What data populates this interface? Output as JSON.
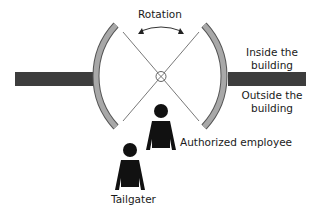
{
  "diagram": {
    "type": "revolving-door-tailgating",
    "labels": {
      "rotation": "Rotation",
      "inside_line1": "Inside the",
      "inside_line2": "building",
      "outside_line1": "Outside the",
      "outside_line2": "building",
      "authorized": "Authorized employee",
      "tailgater": "Tailgater"
    },
    "colors": {
      "wall": "#3d3d3d",
      "door_arc_fill": "#a8a8a8",
      "door_arc_stroke": "#555555",
      "blade": "#555555",
      "person": "#111111",
      "text": "#1a1a1a"
    }
  }
}
